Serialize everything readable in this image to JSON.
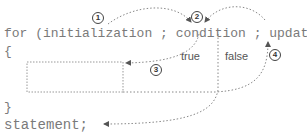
{
  "code": {
    "for_line": "for (initialization ; condition ; update)",
    "open_brace": "{",
    "close_brace": "}",
    "statement": "statement;"
  },
  "labels": {
    "true": "true",
    "false": "false"
  },
  "steps": [
    "1",
    "2",
    "3",
    "4"
  ],
  "colors": {
    "text": "#7a7a7a",
    "line": "#888888",
    "circle": "#444444"
  }
}
